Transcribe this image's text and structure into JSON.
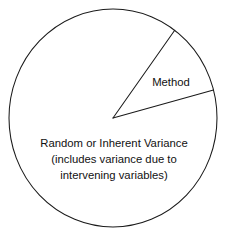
{
  "figure": {
    "type": "pie-diagram",
    "background_color": "#ffffff",
    "outline_color": "#1a1a1a",
    "text_color": "#111111"
  },
  "chart_data": {
    "type": "pie",
    "title": "",
    "subtitle": "",
    "xlabel": "",
    "ylabel": "",
    "grid": false,
    "legend_position": "none",
    "center": {
      "x": 113,
      "y": 118
    },
    "radius_x": 104,
    "radius_y": 109,
    "start_angle_deg": -53.6,
    "categories": [
      "Method",
      "Random or Inherent Variance"
    ],
    "values": [
      10.8,
      89.2
    ],
    "value_unit": "percent",
    "slices": [
      {
        "name": "Method",
        "label": "Method",
        "value": 10.8,
        "angle_span_deg": 38.7,
        "start_angle_deg": -53.6,
        "end_angle_deg": -14.9,
        "fill": "#ffffff",
        "stroke": "#1a1a1a",
        "label_x": 171,
        "label_y": 86
      },
      {
        "name": "Random or Inherent Variance",
        "label": "Random or Inherent Variance",
        "value": 89.2,
        "angle_span_deg": 321.3,
        "start_angle_deg": -14.9,
        "end_angle_deg": -53.6,
        "fill": "#ffffff",
        "stroke": "#1a1a1a",
        "label_x": 114,
        "label_y": 148
      }
    ]
  },
  "labels": {
    "method": "Method",
    "variance_line1": "Random or Inherent Variance",
    "variance_line2": "(includes variance due to",
    "variance_line3": "intervening variables)"
  }
}
